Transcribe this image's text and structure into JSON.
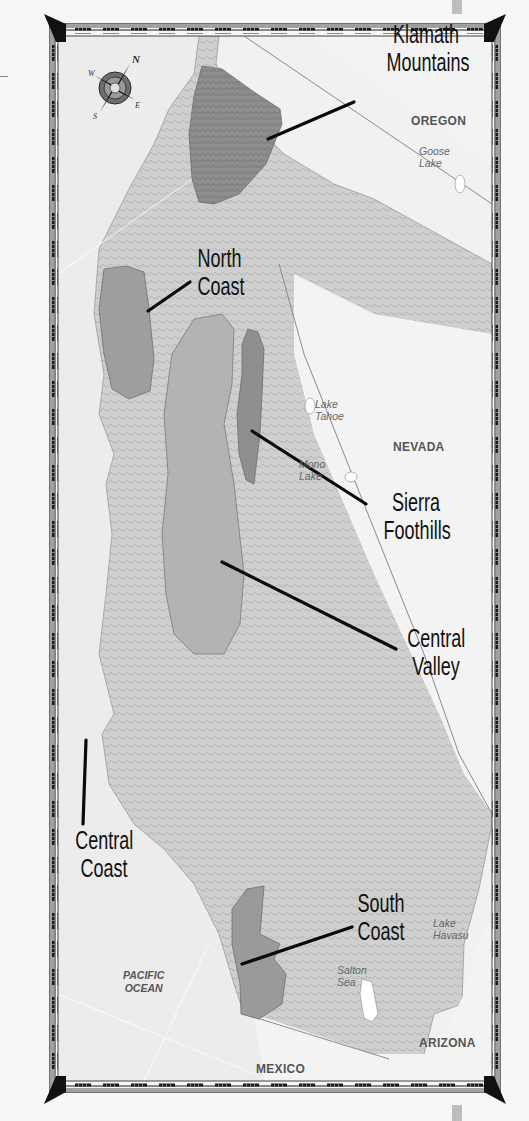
{
  "map": {
    "title": "California Wine Regions",
    "colors": {
      "background": "#f7f7f7",
      "land": "#d9d9d9",
      "land_relief": "#c4c4c4",
      "ocean": "#ececec",
      "outside_state": "#f1f1f1",
      "region_dark": "#8f8f8f",
      "region_medium": "#a8a8a8",
      "region_light": "#b3b3b3",
      "frame_dark": "#1a1a1a",
      "frame_mid": "#8a8a8a",
      "leader_line": "#0a0a0a"
    },
    "compass": {
      "icon": "compass-rose-icon",
      "directions": [
        "N",
        "E",
        "S",
        "W"
      ]
    },
    "regions": [
      {
        "id": "klamath",
        "line1": "Klamath",
        "line2": "Mountains"
      },
      {
        "id": "north-coast",
        "line1": "North",
        "line2": "Coast"
      },
      {
        "id": "sierra-foothills",
        "line1": "Sierra",
        "line2": "Foothills"
      },
      {
        "id": "central-valley",
        "line1": "Central",
        "line2": "Valley"
      },
      {
        "id": "central-coast",
        "line1": "Central",
        "line2": "Coast"
      },
      {
        "id": "south-coast",
        "line1": "South",
        "line2": "Coast"
      }
    ],
    "states": {
      "oregon": "OREGON",
      "nevada": "NEVADA",
      "arizona": "ARIZONA",
      "mexico": "MEXICO"
    },
    "water_bodies": {
      "goose_lake": {
        "line1": "Goose",
        "line2": "Lake"
      },
      "lake_tahoe": {
        "line1": "Lake",
        "line2": "Tahoe"
      },
      "mono_lake": {
        "line1": "Mono",
        "line2": "Lake"
      },
      "lake_havasu": {
        "line1": "Lake",
        "line2": "Havasu"
      },
      "salton_sea": {
        "line1": "Salton",
        "line2": "Sea"
      },
      "pacific_ocean": {
        "line1": "PACIFIC",
        "line2": "OCEAN"
      }
    }
  }
}
